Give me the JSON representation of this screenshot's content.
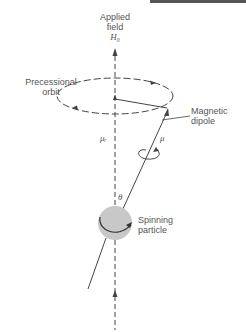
{
  "labels": {
    "applied_field_line1": "Applied",
    "applied_field_line2": "field",
    "field_symbol": "H₀",
    "precessional_line1": "Precessional",
    "precessional_line2": "orbit",
    "magnetic_line1": "Magnetic",
    "magnetic_line2": "dipole",
    "mu_z": "μᵣ",
    "mu": "μ",
    "theta": "θ",
    "spinning_line1": "Spinning",
    "spinning_line2": "particle"
  },
  "colors": {
    "line": "#444444",
    "particle_fill": "#c8c8c8",
    "text": "#555555"
  }
}
